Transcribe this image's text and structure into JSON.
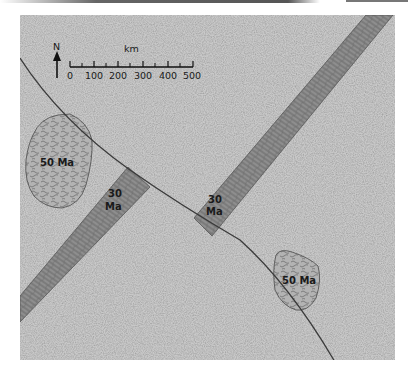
{
  "figure": {
    "type": "geologic-map"
  },
  "scale_bar": {
    "unit": "km",
    "ticks": [
      "0",
      "100",
      "200",
      "300",
      "400",
      "500"
    ]
  },
  "north_arrow": {
    "label": "N"
  },
  "units": {
    "intrusion_left": {
      "label": "50 Ma"
    },
    "intrusion_right": {
      "label": "50 Ma"
    },
    "dike_left": {
      "label_line1": "30",
      "label_line2": "Ma"
    },
    "dike_right": {
      "label_line1": "30",
      "label_line2": "Ma"
    }
  },
  "colors": {
    "background": "#c9c9c9",
    "dike": "#8a8a8a",
    "intrusion": "#a9a9a9",
    "fault": "#3a3a3a"
  }
}
